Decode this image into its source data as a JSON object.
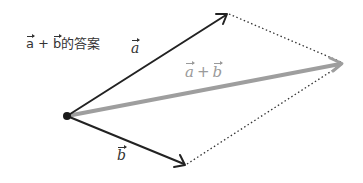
{
  "diagram": {
    "title": {
      "vec_a": "a",
      "plus": "+",
      "vec_b": "b",
      "suffix": "的答案"
    },
    "labels": {
      "a": "a",
      "b": "b",
      "sum_a": "a",
      "sum_plus": "+",
      "sum_b": "b"
    },
    "points": {
      "origin": [
        67,
        116
      ],
      "a_tip": [
        227,
        14
      ],
      "b_tip": [
        185,
        165
      ],
      "sum_tip": [
        343,
        63
      ]
    },
    "colors": {
      "vector": "#222222",
      "sum_vector": "#9e9e9e",
      "dotted": "#333333",
      "origin_dot": "#1a1a1a",
      "sum_label": "#9a9a9a"
    },
    "method": "parallelogram rule"
  }
}
